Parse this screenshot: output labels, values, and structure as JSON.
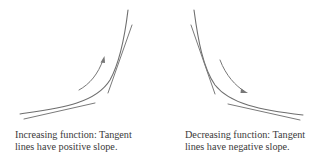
{
  "panels": [
    {
      "id": "increasing",
      "caption_line1": "Increasing function: Tangent",
      "caption_line2": "lines have positive slope.",
      "curve_type": "convex increasing curve",
      "tangent_count": 2,
      "tangent_slope_sign": "positive",
      "arrow_direction": "up-right along curve"
    },
    {
      "id": "decreasing",
      "caption_line1": "Decreasing function: Tangent",
      "caption_line2": "lines have negative slope.",
      "curve_type": "convex decreasing curve",
      "tangent_count": 2,
      "tangent_slope_sign": "negative",
      "arrow_direction": "down-right along curve"
    }
  ],
  "colors": {
    "background": "#ffffff",
    "stroke": "#6e6e6e",
    "text": "#3a3a3a"
  }
}
